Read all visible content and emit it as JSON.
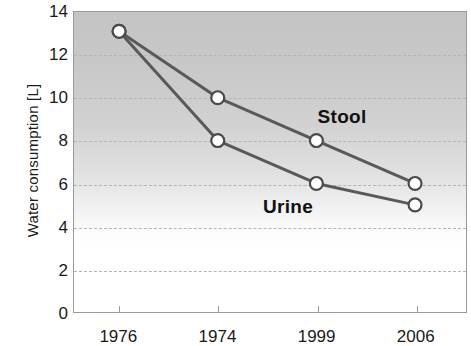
{
  "chart_data": {
    "type": "line",
    "title": "",
    "subtitle": "",
    "xlabel": "",
    "ylabel": "Water consumption [L]",
    "categories": [
      "1976",
      "1974",
      "1999",
      "2006"
    ],
    "series": [
      {
        "name": "Stool",
        "values": [
          13.1,
          10.0,
          8.0,
          6.0
        ]
      },
      {
        "name": "Urine",
        "values": [
          13.1,
          8.0,
          6.0,
          5.0
        ]
      }
    ],
    "ylim": [
      0,
      14
    ],
    "yticks": [
      0,
      2,
      4,
      6,
      8,
      10,
      12,
      14
    ],
    "ytick_labels": [
      "0",
      "2",
      "4",
      "6",
      "8",
      "10",
      "12",
      "14"
    ],
    "grid": "horizontal-dashed",
    "legend": "inline-annotations",
    "annotations": [
      {
        "text": "Stool",
        "x": 2.0,
        "y": 9.1
      },
      {
        "text": "Urine",
        "x": 1.45,
        "y": 4.9
      }
    ],
    "colors": {
      "line": "#595959",
      "marker_fill": "#ffffff",
      "marker_edge": "#4a4a4a",
      "gridline": "#b4b4b4",
      "axis": "#9a9a9a",
      "plot_bg_top": "#c4c4c4",
      "plot_bg_bottom": "#ffffff",
      "text": "#1a1a1a"
    }
  }
}
